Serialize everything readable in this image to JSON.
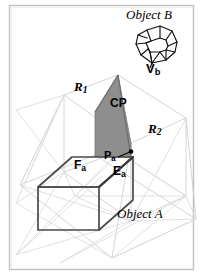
{
  "figure": {
    "title_caption": "",
    "colors": {
      "background": "#ffffff",
      "frame_border": "#c9c9c9",
      "construction_line": "#cccccc",
      "construction_line_light": "#dadada",
      "object_a_edge": "#4a4a4a",
      "object_b_edge": "#111111",
      "cp_plane_fill": "#8c8c8c",
      "cp_plane_edge": "#6e6e6e",
      "text": "#000000"
    },
    "labels": {
      "object_b": "Object B",
      "vb_base": "V",
      "vb_sub": "b",
      "r1_base": "R",
      "r1_sub": "1",
      "cp": "CP",
      "r2_base": "R",
      "r2_sub": "2",
      "fa_base": "F",
      "fa_sub": "a",
      "pa_base": "P",
      "pa_sub": "a",
      "ea_base": "E",
      "ea_sub": "a",
      "object_a": "Object A"
    },
    "elements": {
      "object_a_name": "box-object-a",
      "object_b_name": "polyhedron-object-b",
      "cp_plane_name": "clipping-plane-cp",
      "region_1_name": "region-r1",
      "region_2_name": "region-r2",
      "vertex_marker_name": "vertex-point-pa"
    }
  }
}
